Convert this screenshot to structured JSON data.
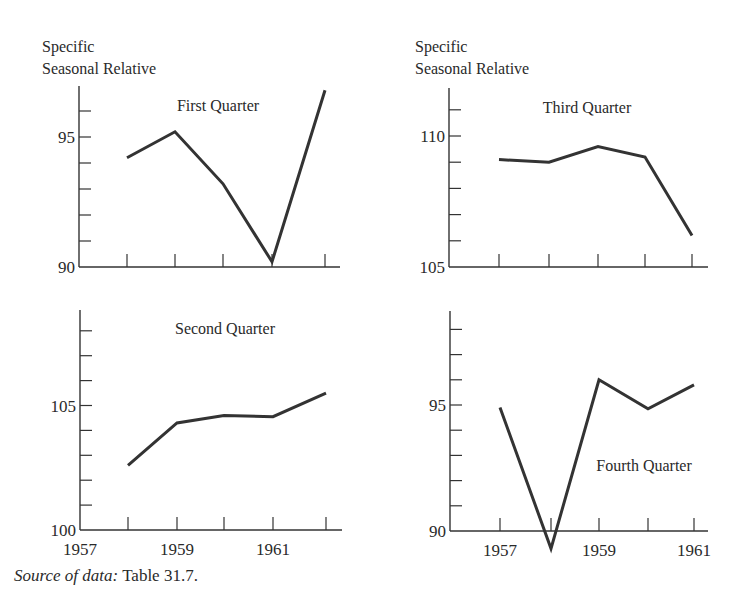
{
  "figure": {
    "ylabel_line1": "Specific",
    "ylabel_line2": "Seasonal Relative",
    "source_label": "Source of data:",
    "source_ref": "Table 31.7.",
    "line_color": "#333333",
    "axis_color": "#333333"
  },
  "chart_data": [
    {
      "type": "line",
      "title": "First Quarter",
      "ylabel": "Specific Seasonal Relative",
      "xlabel": "",
      "x": [
        1958,
        1959,
        1960,
        1961,
        1962
      ],
      "values": [
        94.2,
        95.2,
        93.2,
        90.2,
        96.8
      ],
      "ylim": [
        90,
        97.5
      ],
      "yticks_labeled": [
        90,
        95
      ],
      "ytick_step": 1,
      "xtick_labels": [],
      "grid": false,
      "position": "top-left",
      "layout": {
        "ox": 79,
        "oy": 267,
        "xend": 340,
        "ytop": 86,
        "unit": 26,
        "ymin": 90,
        "xt": [
          127,
          175,
          223,
          272,
          325
        ],
        "title_x": 218,
        "title_y": 111
      }
    },
    {
      "type": "line",
      "title": "Third Quarter",
      "ylabel": "Specific Seasonal Relative",
      "xlabel": "",
      "x": [
        1958,
        1959,
        1960,
        1961,
        1962
      ],
      "values": [
        109.1,
        109.0,
        109.6,
        109.2,
        106.2
      ],
      "ylim": [
        105,
        112
      ],
      "yticks_labeled": [
        105,
        110
      ],
      "ytick_step": 1,
      "xtick_labels": [],
      "grid": false,
      "position": "top-right",
      "layout": {
        "ox": 449,
        "oy": 267,
        "xend": 708,
        "ytop": 88,
        "unit": 26.2,
        "ymin": 105,
        "xt": [
          499,
          549,
          598,
          645,
          692
        ],
        "title_x": 587,
        "title_y": 113
      }
    },
    {
      "type": "line",
      "title": "Second Quarter",
      "ylabel": "Specific Seasonal Relative",
      "xlabel": "",
      "x": [
        1958,
        1959,
        1960,
        1961,
        1962
      ],
      "values": [
        102.6,
        104.3,
        104.6,
        104.55,
        105.5
      ],
      "ylim": [
        100,
        108.5
      ],
      "yticks_labeled": [
        100,
        105
      ],
      "ytick_step": 1,
      "xtick_labels": [
        {
          "label": "1957",
          "pos": 0
        },
        {
          "label": "1959",
          "pos": 2
        },
        {
          "label": "1961",
          "pos": 4
        }
      ],
      "grid": false,
      "position": "bottom-left",
      "layout": {
        "ox": 80,
        "oy": 530,
        "xend": 342,
        "ytop": 310,
        "unit": 24.9,
        "ymin": 100,
        "xt": [
          128,
          177,
          224,
          273,
          326
        ],
        "title_x": 225,
        "title_y": 334
      }
    },
    {
      "type": "line",
      "title": "Fourth Quarter",
      "ylabel": "Specific Seasonal Relative",
      "xlabel": "",
      "x": [
        1957,
        1958,
        1959,
        1960,
        1961
      ],
      "values": [
        94.9,
        89.3,
        96.0,
        94.85,
        95.8
      ],
      "ylim": [
        88,
        97.5
      ],
      "yticks_labeled": [
        90,
        95
      ],
      "ytick_step": 1,
      "xtick_labels": [
        {
          "label": "1957",
          "pos": 1
        },
        {
          "label": "1959",
          "pos": 3
        },
        {
          "label": "1961",
          "pos": 5
        }
      ],
      "grid": false,
      "position": "bottom-right",
      "layout": {
        "ox": 450,
        "oy": 531,
        "xend": 708,
        "ytop": 311,
        "unit": 25.2,
        "ymin": 90,
        "xt": [
          500,
          551,
          599,
          648,
          694
        ],
        "title_x": 644,
        "title_y": 471
      }
    }
  ]
}
